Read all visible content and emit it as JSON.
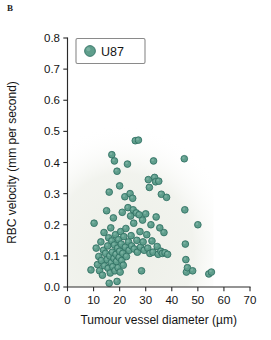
{
  "figure": {
    "panel_label": "B",
    "marker_color": "#5f9e8c",
    "marker_edge_color": "#2f6f62",
    "axis_color": "#2a2a2a",
    "plot_background_tint": "#edefe8"
  },
  "legend": {
    "entries": [
      {
        "label": "U87",
        "marker": "circle",
        "color": "#5f9e8c"
      }
    ]
  },
  "chart_data": {
    "type": "scatter",
    "title": "",
    "xlabel": "Tumour vessel diameter (µm)",
    "ylabel": "RBC velocity (mm per second)",
    "xlim": [
      0,
      70
    ],
    "ylim": [
      0.0,
      0.8
    ],
    "xticks": [
      0,
      10,
      20,
      30,
      40,
      50,
      60,
      70
    ],
    "yticks": [
      0.0,
      0.1,
      0.2,
      0.3,
      0.4,
      0.5,
      0.6,
      0.7,
      0.8
    ],
    "xticklabels": [
      "0",
      "10",
      "20",
      "30",
      "40",
      "50",
      "60",
      "70"
    ],
    "yticklabels": [
      "0.0",
      "0.1",
      "0.2",
      "0.3",
      "0.4",
      "0.5",
      "0.6",
      "0.7",
      "0.8"
    ],
    "grid": false,
    "legend_position": "upper left",
    "series": [
      {
        "name": "U87",
        "marker": "circle",
        "color": "#5f9e8c",
        "points": [
          [
            9.0,
            0.055
          ],
          [
            10.2,
            0.205
          ],
          [
            11.0,
            0.125
          ],
          [
            11.5,
            0.072
          ],
          [
            12.0,
            0.098
          ],
          [
            12.3,
            0.052
          ],
          [
            12.8,
            0.145
          ],
          [
            13.0,
            0.085
          ],
          [
            13.4,
            0.038
          ],
          [
            13.8,
            0.118
          ],
          [
            14.0,
            0.175
          ],
          [
            14.2,
            0.068
          ],
          [
            14.6,
            0.108
          ],
          [
            15.0,
            0.245
          ],
          [
            15.2,
            0.088
          ],
          [
            15.4,
            0.132
          ],
          [
            15.6,
            0.06
          ],
          [
            15.8,
            0.158
          ],
          [
            16.0,
            0.012
          ],
          [
            16.0,
            0.305
          ],
          [
            16.2,
            0.1
          ],
          [
            16.4,
            0.045
          ],
          [
            16.6,
            0.19
          ],
          [
            16.8,
            0.078
          ],
          [
            17.0,
            0.425
          ],
          [
            17.0,
            0.148
          ],
          [
            17.2,
            0.112
          ],
          [
            17.4,
            0.065
          ],
          [
            17.6,
            0.222
          ],
          [
            17.8,
            0.092
          ],
          [
            18.0,
            0.405
          ],
          [
            18.0,
            0.135
          ],
          [
            18.2,
            0.052
          ],
          [
            18.4,
            0.168
          ],
          [
            18.6,
            0.105
          ],
          [
            18.8,
            0.082
          ],
          [
            19.0,
            0.372
          ],
          [
            19.0,
            0.018
          ],
          [
            19.2,
            0.125
          ],
          [
            19.4,
            0.062
          ],
          [
            19.6,
            0.152
          ],
          [
            19.8,
            0.095
          ],
          [
            20.0,
            0.325
          ],
          [
            20.0,
            0.115
          ],
          [
            20.2,
            0.048
          ],
          [
            20.4,
            0.178
          ],
          [
            20.6,
            0.138
          ],
          [
            20.8,
            0.085
          ],
          [
            21.0,
            0.24
          ],
          [
            21.2,
            0.108
          ],
          [
            21.4,
            0.07
          ],
          [
            21.6,
            0.162
          ],
          [
            22.0,
            0.29
          ],
          [
            22.2,
            0.128
          ],
          [
            22.4,
            0.188
          ],
          [
            22.6,
            0.098
          ],
          [
            23.0,
            0.395
          ],
          [
            23.2,
            0.255
          ],
          [
            23.4,
            0.145
          ],
          [
            23.6,
            0.118
          ],
          [
            24.0,
            0.3
          ],
          [
            24.2,
            0.228
          ],
          [
            24.4,
            0.165
          ],
          [
            24.6,
            0.132
          ],
          [
            25.0,
            0.285
          ],
          [
            25.2,
            0.248
          ],
          [
            25.4,
            0.205
          ],
          [
            25.6,
            0.122
          ],
          [
            26.0,
            0.47
          ],
          [
            26.4,
            0.238
          ],
          [
            26.6,
            0.15
          ],
          [
            26.8,
            0.112
          ],
          [
            27.2,
            0.472
          ],
          [
            27.5,
            0.232
          ],
          [
            27.8,
            0.178
          ],
          [
            28.0,
            0.128
          ],
          [
            28.4,
            0.052
          ],
          [
            28.8,
            0.215
          ],
          [
            29.0,
            0.145
          ],
          [
            29.4,
            0.118
          ],
          [
            30.0,
            0.235
          ],
          [
            30.4,
            0.168
          ],
          [
            30.8,
            0.125
          ],
          [
            31.0,
            0.345
          ],
          [
            31.4,
            0.32
          ],
          [
            31.6,
            0.108
          ],
          [
            32.0,
            0.2
          ],
          [
            32.4,
            0.148
          ],
          [
            32.8,
            0.112
          ],
          [
            33.0,
            0.405
          ],
          [
            33.4,
            0.352
          ],
          [
            33.8,
            0.338
          ],
          [
            34.0,
            0.225
          ],
          [
            34.4,
            0.13
          ],
          [
            34.8,
            0.105
          ],
          [
            35.0,
            0.34
          ],
          [
            35.4,
            0.19
          ],
          [
            35.8,
            0.115
          ],
          [
            36.0,
            0.298
          ],
          [
            36.4,
            0.108
          ],
          [
            37.0,
            0.175
          ],
          [
            37.4,
            0.11
          ],
          [
            38.0,
            0.288
          ],
          [
            38.4,
            0.105
          ],
          [
            44.8,
            0.412
          ],
          [
            45.0,
            0.248
          ],
          [
            45.2,
            0.138
          ],
          [
            45.4,
            0.088
          ],
          [
            45.6,
            0.048
          ],
          [
            46.0,
            0.062
          ],
          [
            48.0,
            0.052
          ],
          [
            50.0,
            0.2
          ],
          [
            54.2,
            0.042
          ],
          [
            55.2,
            0.048
          ]
        ]
      }
    ]
  }
}
